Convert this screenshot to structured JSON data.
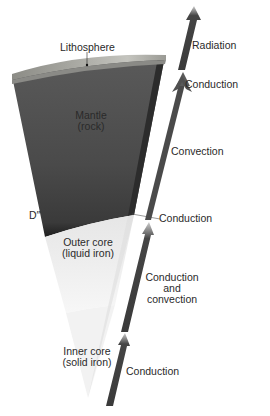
{
  "diagram": {
    "type": "earth-interior-heat-transfer",
    "layers": {
      "lithosphere": "Lithosphere",
      "mantle": [
        "Mantle",
        "(rock)"
      ],
      "d_double_prime": "D″",
      "outer_core": [
        "Outer core",
        "(liquid iron)"
      ],
      "inner_core": [
        "Inner core",
        "(solid iron)"
      ]
    },
    "heat_transfer": {
      "radiation": "Radiation",
      "conduction_top": "Conduction",
      "convection": "Convection",
      "conduction_cmb": "Conduction",
      "outer_core": [
        "Conduction",
        "and",
        "convection"
      ],
      "conduction_inner": "Conduction"
    },
    "colors": {
      "mantle": "#4a4a4a",
      "lithosphere": "#9a9a94",
      "outer_core": "#ececec",
      "inner_core": "#f4f4f4",
      "arrow": "#3c3c3c"
    }
  }
}
